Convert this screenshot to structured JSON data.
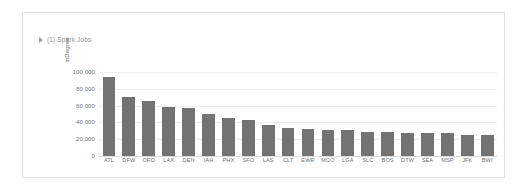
{
  "cell": {
    "spark_jobs": {
      "caret_icon": "caret-right-icon",
      "label": "(1) Spark Jobs"
    }
  },
  "chart_data": {
    "type": "bar",
    "title": "",
    "subtitle": "",
    "xlabel": "",
    "ylabel": "inDegree",
    "ylim": [
      0,
      100000
    ],
    "grid": true,
    "legend": null,
    "bar_color": "#737373",
    "axis_label_color": "#6b7074",
    "gridline_color": "#ededed",
    "y_ticks": [
      "0",
      "20,000",
      "40,000",
      "60,000",
      "80,000",
      "100,000"
    ],
    "y_tick_values": [
      0,
      20000,
      40000,
      60000,
      80000,
      100000
    ],
    "categories": [
      "ATL",
      "DFW",
      "ORD",
      "LAX",
      "DEN",
      "IAH",
      "PHX",
      "SFO",
      "LAS",
      "CLT",
      "EWR",
      "MCO",
      "LGA",
      "SLC",
      "BOS",
      "DTW",
      "SEA",
      "MSP",
      "JFK",
      "BWI"
    ],
    "values": [
      94000,
      70000,
      65000,
      58000,
      57000,
      50000,
      45000,
      43000,
      37000,
      33000,
      32000,
      31500,
      31000,
      29000,
      28000,
      27500,
      27000,
      27000,
      25500,
      25000
    ]
  }
}
